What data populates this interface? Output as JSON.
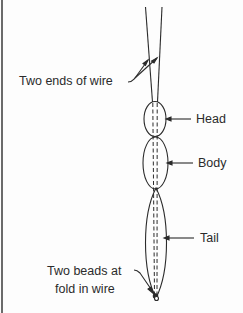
{
  "figure": {
    "labels": {
      "wire_ends": "Two ends of wire",
      "head": "Head",
      "body": "Body",
      "tail": "Tail",
      "beads_line1": "Two beads at",
      "beads_line2": "fold in wire"
    },
    "colors": {
      "line": "#2b2b2b",
      "background": "#fdfdfd",
      "border": "#6b6b6b"
    }
  }
}
